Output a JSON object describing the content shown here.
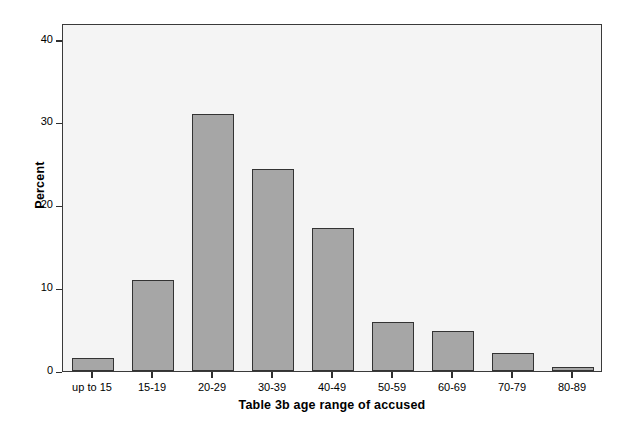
{
  "chart_data": {
    "type": "bar",
    "title": "",
    "xlabel": "Table 3b age range of accused",
    "ylabel": "Percent",
    "categories": [
      "up to 15",
      "15-19",
      "20-29",
      "30-39",
      "40-49",
      "50-59",
      "60-69",
      "70-79",
      "80-89"
    ],
    "values": [
      1.6,
      11.0,
      31.0,
      24.4,
      17.3,
      5.9,
      4.8,
      2.2,
      0.5
    ],
    "ylim": [
      0,
      42
    ],
    "yticks": [
      0,
      10,
      20,
      30,
      40
    ],
    "ytick_labels": [
      "0",
      "10",
      "20",
      "30",
      "40"
    ],
    "grid": false,
    "legend": "none",
    "colors": {
      "bar_fill": "#a6a6a6",
      "bar_edge": "#333333",
      "plot_background": "#f4f4f4",
      "frame": "#3a3a3a",
      "text": "#000000"
    }
  }
}
